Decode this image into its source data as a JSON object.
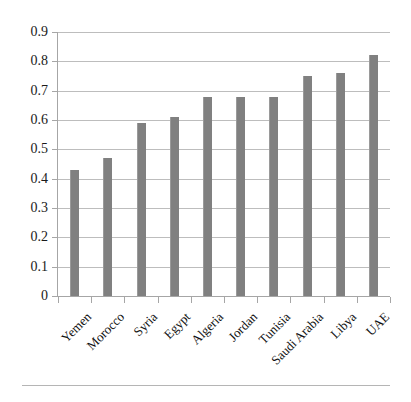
{
  "chart_data": {
    "type": "bar",
    "title": "",
    "subtitle": "",
    "xlabel": "",
    "ylabel": "",
    "categories": [
      "Yemen",
      "Morocco",
      "Syria",
      "Egypt",
      "Algeria",
      "Jordan",
      "Tunisia",
      "Saudi Arabia",
      "Libya",
      "UAE"
    ],
    "values": [
      0.43,
      0.47,
      0.59,
      0.61,
      0.68,
      0.68,
      0.68,
      0.75,
      0.76,
      0.82
    ],
    "series": [
      {
        "name": "",
        "values": [
          0.43,
          0.47,
          0.59,
          0.61,
          0.68,
          0.68,
          0.68,
          0.75,
          0.76,
          0.82
        ]
      }
    ],
    "ylim": [
      0,
      0.9
    ],
    "ytick_labels": [
      "0",
      "0.1",
      "0.2",
      "0.3",
      "0.4",
      "0.5",
      "0.6",
      "0.7",
      "0.8",
      "0.9"
    ],
    "ytick_values": [
      0,
      0.1,
      0.2,
      0.3,
      0.4,
      0.5,
      0.6,
      0.7,
      0.8,
      0.9
    ],
    "grid": true,
    "grid_axis": "y",
    "legend": false,
    "legend_position": "none",
    "bar_color": "#808080",
    "gridline_color": "#bdbdbd",
    "axis_color": "#a6a6a6",
    "xlabel_rotation": -45,
    "annotations": []
  }
}
